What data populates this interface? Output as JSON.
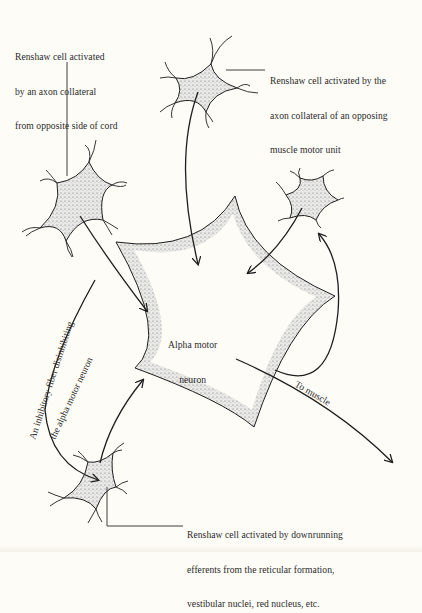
{
  "figure": {
    "labels": {
      "top_left": [
        "Renshaw cell activated",
        "by an axon collateral",
        "from opposite side of cord"
      ],
      "top_right": [
        "Renshaw cell activated by the",
        "axon collateral of an opposing",
        "muscle motor unit"
      ],
      "bottom": [
        "Renshaw cell activated by downrunning",
        "efferents from the reticular formation,",
        "vestibular nuclei, red nucleus, etc."
      ],
      "center": [
        "Alpha motor",
        "neuron"
      ],
      "inhibitory_fiber_line1": "An inhibitory fiber disinhibiting",
      "inhibitory_fiber_line2": "the alpha motor neuron",
      "to_muscle": "To muscle"
    },
    "cells": [
      {
        "name": "alpha-motor-neuron",
        "type": "large stippled star"
      },
      {
        "name": "renshaw-cell-top",
        "type": "small stippled cell"
      },
      {
        "name": "renshaw-cell-left",
        "type": "small stippled cell"
      },
      {
        "name": "renshaw-cell-right",
        "type": "small stippled cell"
      },
      {
        "name": "renshaw-cell-bottom",
        "type": "small stippled cell"
      }
    ],
    "colors": {
      "background": "#fdfcf6",
      "ink": "#1e1e1e",
      "stipple": "#8a8a8a"
    }
  }
}
